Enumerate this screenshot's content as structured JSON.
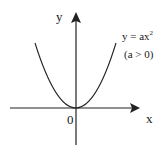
{
  "diagram": {
    "axis_x_label": "x",
    "axis_y_label": "y",
    "origin_label": "0",
    "equation_base": "y = ax",
    "equation_exponent": "2",
    "condition": "(a > 0)",
    "curve": {
      "type": "parabola",
      "opens": "up",
      "vertex": "origin"
    },
    "colors": {
      "stroke": "#222222",
      "background": "#ffffff"
    }
  }
}
